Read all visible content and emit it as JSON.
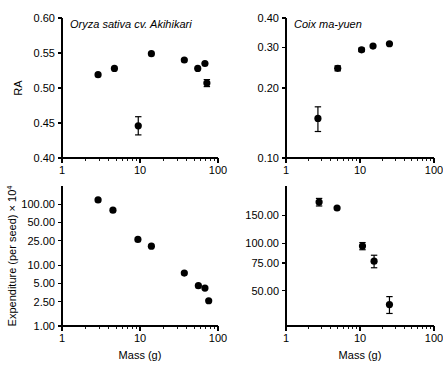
{
  "figure": {
    "background": "#ffffff",
    "marker_color": "#000000",
    "axis_color": "#000000"
  },
  "labels": {
    "mass_axis": "Mass (g)",
    "ra_axis": "RA",
    "expenditure_axis_main": "Expenditure (per seed) × 10",
    "expenditure_axis_exponent": "4"
  },
  "chart_data": [
    {
      "id": "panel-top-left",
      "type": "scatter",
      "title": "Oryza sativa cv. Akihikari",
      "xlabel": "",
      "ylabel": "RA",
      "xscale": "log",
      "yscale": "linear",
      "xlim": [
        1,
        100
      ],
      "ylim": [
        0.4,
        0.6
      ],
      "xticks": [
        1,
        10,
        100
      ],
      "xticklabels": [
        "1",
        "10",
        "100"
      ],
      "yticks": [
        0.4,
        0.45,
        0.5,
        0.55,
        0.6
      ],
      "yticklabels": [
        "0.40",
        "0.45",
        "0.50",
        "0.55",
        "0.60"
      ],
      "grid": false,
      "legend": "none",
      "points": [
        {
          "x": 2.9,
          "y": 0.519,
          "yerr": 0
        },
        {
          "x": 4.7,
          "y": 0.528,
          "yerr": 0
        },
        {
          "x": 9.5,
          "y": 0.446,
          "yerr": 0.013
        },
        {
          "x": 14.0,
          "y": 0.549,
          "yerr": 0
        },
        {
          "x": 37.0,
          "y": 0.54,
          "yerr": 0
        },
        {
          "x": 55.0,
          "y": 0.528,
          "yerr": 0
        },
        {
          "x": 68.0,
          "y": 0.535,
          "yerr": 0
        },
        {
          "x": 72.0,
          "y": 0.507,
          "yerr": 0.005
        }
      ]
    },
    {
      "id": "panel-top-right",
      "type": "scatter",
      "title": "Coix ma-yuen",
      "xlabel": "",
      "ylabel": "",
      "xscale": "log",
      "yscale": "log",
      "xlim": [
        1,
        100
      ],
      "ylim": [
        0.1,
        0.4
      ],
      "xticks": [
        1,
        10,
        100
      ],
      "xticklabels": [
        "1",
        "10",
        "100"
      ],
      "yticks": [
        0.1,
        0.2,
        0.3,
        0.4
      ],
      "yticklabels": [
        "0.10",
        "0.20",
        "0.30",
        "0.40"
      ],
      "grid": false,
      "legend": "none",
      "points": [
        {
          "x": 2.7,
          "y": 0.148,
          "yerr": 0.018
        },
        {
          "x": 5.0,
          "y": 0.243,
          "yerr": 0.006
        },
        {
          "x": 10.5,
          "y": 0.292,
          "yerr": 0.005
        },
        {
          "x": 15.0,
          "y": 0.303,
          "yerr": 0
        },
        {
          "x": 25.0,
          "y": 0.31,
          "yerr": 0
        }
      ]
    },
    {
      "id": "panel-bottom-left",
      "type": "scatter",
      "title": "",
      "xlabel": "Mass (g)",
      "ylabel": "Expenditure (per seed) × 10⁴",
      "xscale": "log",
      "yscale": "log",
      "xlim": [
        1,
        100
      ],
      "ylim": [
        1.0,
        200.0
      ],
      "xticks": [
        1,
        10,
        100
      ],
      "xticklabels": [
        "1",
        "10",
        "100"
      ],
      "yticks": [
        1.0,
        2.5,
        5.0,
        10.0,
        25.0,
        50.0,
        100.0
      ],
      "yticklabels": [
        "1.00",
        "2.50",
        "5.00",
        "10.00",
        "25.00",
        "50.00",
        "100.00"
      ],
      "grid": false,
      "legend": "none",
      "points": [
        {
          "x": 2.9,
          "y": 118.0,
          "yerr": 0
        },
        {
          "x": 4.5,
          "y": 80.0,
          "yerr": 0
        },
        {
          "x": 9.4,
          "y": 26.5,
          "yerr": 0
        },
        {
          "x": 14.0,
          "y": 20.5,
          "yerr": 0
        },
        {
          "x": 37.0,
          "y": 7.4,
          "yerr": 0
        },
        {
          "x": 56.0,
          "y": 4.6,
          "yerr": 0
        },
        {
          "x": 68.0,
          "y": 4.2,
          "yerr": 0
        },
        {
          "x": 76.0,
          "y": 2.6,
          "yerr": 0
        }
      ]
    },
    {
      "id": "panel-bottom-right",
      "type": "scatter",
      "title": "",
      "xlabel": "Mass (g)",
      "ylabel": "",
      "xscale": "log",
      "yscale": "log",
      "xlim": [
        1,
        100
      ],
      "ylim": [
        30.0,
        230.0
      ],
      "xticks": [
        1,
        10,
        100
      ],
      "xticklabels": [
        "1",
        "10",
        "100"
      ],
      "yticks": [
        50.0,
        75.0,
        100.0,
        150.0
      ],
      "yticklabels": [
        "50.00",
        "75.00",
        "100.00",
        "150.00"
      ],
      "grid": false,
      "legend": "none",
      "points": [
        {
          "x": 2.8,
          "y": 182.0,
          "yerr": 10.0
        },
        {
          "x": 4.9,
          "y": 167.0,
          "yerr": 0
        },
        {
          "x": 10.8,
          "y": 96.0,
          "yerr": 5.0
        },
        {
          "x": 15.5,
          "y": 77.0,
          "yerr": 7.0
        },
        {
          "x": 25.0,
          "y": 41.0,
          "yerr": 5.0
        }
      ]
    }
  ]
}
